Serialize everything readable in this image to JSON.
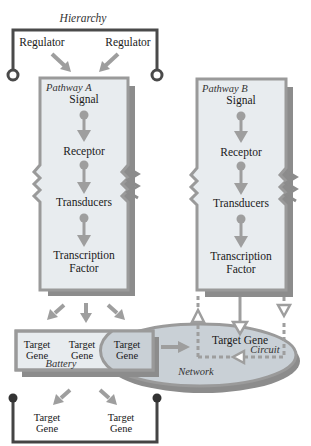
{
  "diagram": {
    "hierarchy": {
      "label": "Hierarchy",
      "regulators": [
        "Regulator",
        "Regulator"
      ]
    },
    "pathway_a": {
      "label": "Pathway A",
      "steps": [
        "Signal",
        "Receptor",
        "Transducers",
        "Transcription",
        "Factor"
      ]
    },
    "pathway_b": {
      "label": "Pathway B",
      "steps": [
        "Signal",
        "Receptor",
        "Transducers",
        "Transcription",
        "Factor"
      ]
    },
    "battery": {
      "label": "Battery",
      "genes": [
        {
          "line1": "Target",
          "line2": "Gene"
        },
        {
          "line1": "Target",
          "line2": "Gene"
        },
        {
          "line1": "Target",
          "line2": "Gene"
        }
      ]
    },
    "network": {
      "label": "Network",
      "target_gene": "Target Gene",
      "circuit_label": "Circuit"
    },
    "bottom_hierarchy": {
      "genes": [
        {
          "line1": "Target",
          "line2": "Gene"
        },
        {
          "line1": "Target",
          "line2": "Gene"
        }
      ]
    }
  },
  "colors": {
    "box_fill": "#e8ecef",
    "box_border": "#9a9a9a",
    "shadow": "#8c8c8c",
    "arrow": "#9e9e9e",
    "bracket": "#444444",
    "ellipse_fill": "#c9d0d6",
    "text": "#1a1a1a"
  }
}
